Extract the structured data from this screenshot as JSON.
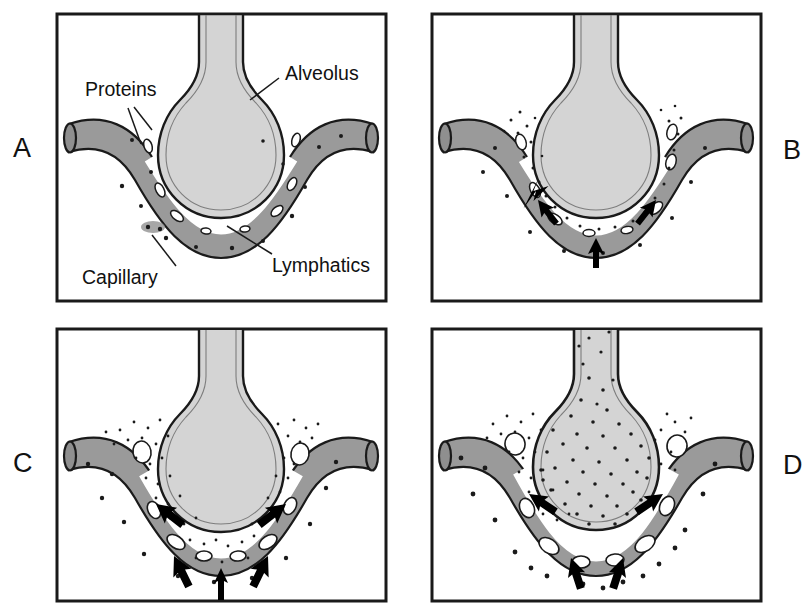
{
  "figure": {
    "background_color": "#ffffff",
    "panel_count": 4
  },
  "palette": {
    "capillary_fill": "#9a9a9a",
    "capillary_stroke": "#1a1a1a",
    "alveolus_fill": "#d4d4d4",
    "alveolus_stroke": "#1a1a1a",
    "interstitium_fill": "#ffffff",
    "lymphatic_stroke": "#1a1a1a",
    "protein_dot": "#1a1a1a",
    "arrow_fill": "#000000",
    "panel_border": "#1a1a1a",
    "text": "#111111"
  },
  "labels": {
    "proteins": "Proteins",
    "alveolus": "Alveolus",
    "capillary": "Capillary",
    "lymphatics": "Lymphatics"
  },
  "panels": [
    {
      "id": "A",
      "letter": "A",
      "letter_side": "left",
      "stage": "normal",
      "caption": "Normal alveolar-capillary unit",
      "has_labels": true,
      "arrow_count": 0,
      "interstitial_fluid": "none",
      "alveolar_flooding": false,
      "protein_density": "low",
      "box": {
        "x": 57,
        "y": 14,
        "w": 329,
        "h": 287
      }
    },
    {
      "id": "B",
      "letter": "B",
      "letter_side": "right",
      "stage": "early-interstitial-edema",
      "caption": "Fluid leaks into interstitium",
      "has_labels": false,
      "arrow_count": 3,
      "interstitial_fluid": "mild",
      "alveolar_flooding": false,
      "protein_density": "medium",
      "box": {
        "x": 432,
        "y": 14,
        "w": 329,
        "h": 287
      }
    },
    {
      "id": "C",
      "letter": "C",
      "letter_side": "left",
      "stage": "interstitial-edema",
      "caption": "Interstitial space distended, lymphatics engorged",
      "has_labels": false,
      "arrow_count": 5,
      "interstitial_fluid": "moderate",
      "alveolar_flooding": false,
      "protein_density": "high",
      "box": {
        "x": 57,
        "y": 329,
        "w": 329,
        "h": 272
      }
    },
    {
      "id": "D",
      "letter": "D",
      "letter_side": "right",
      "stage": "alveolar-flooding",
      "caption": "Alveolus floods with protein-rich fluid",
      "has_labels": false,
      "arrow_count": 4,
      "interstitial_fluid": "severe",
      "alveolar_flooding": true,
      "protein_density": "very-high",
      "box": {
        "x": 432,
        "y": 329,
        "w": 329,
        "h": 272
      }
    }
  ]
}
